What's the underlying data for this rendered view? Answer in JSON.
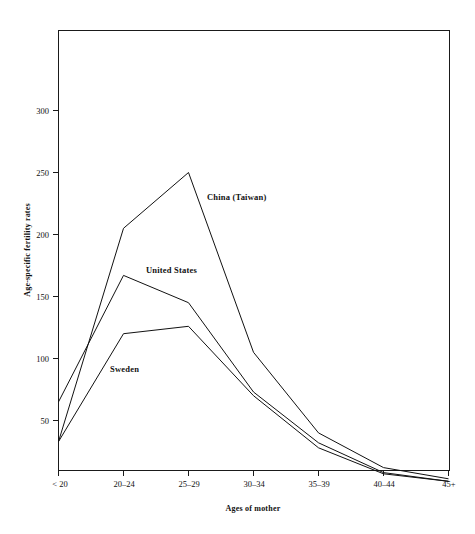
{
  "chart_data": {
    "type": "line",
    "title": "",
    "xlabel": "Ages of mother",
    "ylabel": "Age-specific fertility rates",
    "categories": [
      "< 20",
      "20–24",
      "25–29",
      "30–34",
      "35–39",
      "40–44",
      "45+"
    ],
    "series": [
      {
        "name": "China (Taiwan)",
        "values": [
          33,
          205,
          250,
          105,
          40,
          12,
          3
        ],
        "label_x_category": "25–29",
        "annotation": "China (Taiwan)"
      },
      {
        "name": "United States",
        "values": [
          65,
          167,
          145,
          73,
          32,
          8,
          1
        ],
        "label_x_category": "20–24",
        "annotation": "United States"
      },
      {
        "name": "Sweden",
        "values": [
          33,
          120,
          126,
          70,
          28,
          7,
          1
        ],
        "label_x_category": "< 20",
        "annotation": "Sweden"
      }
    ],
    "ylim": [
      0,
      345
    ],
    "yticks": [
      50,
      100,
      150,
      200,
      250,
      300
    ],
    "ytick_labels": [
      "50",
      "100",
      "150",
      "200",
      "250",
      "300"
    ],
    "grid": false,
    "legend_position": "inline-annotations",
    "axis_color": "#1a1a1a",
    "line_color": "#111111",
    "background": "#ffffff"
  },
  "axes": {
    "y_title": "Age-specific fertility rates",
    "x_title": "Ages of mother"
  },
  "ticks": {
    "y": [
      "300",
      "250",
      "200",
      "150",
      "100",
      "50"
    ],
    "x": [
      "< 20",
      "20–24",
      "25–29",
      "30–34",
      "35–39",
      "40–44",
      "45+"
    ]
  },
  "annotations": {
    "china": "China (Taiwan)",
    "united_states": "United States",
    "sweden": "Sweden"
  }
}
